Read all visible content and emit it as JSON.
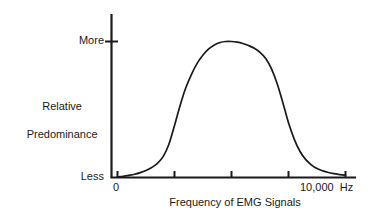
{
  "chart_data": {
    "type": "line",
    "title": "",
    "xlabel": "Frequency of EMG Signals",
    "ylabel": "Relative Predominance",
    "x_unit": "Hz",
    "x_tick_labels": [
      "0",
      "10,000"
    ],
    "x_unit_label": "Hz",
    "x_max_label": "10,000",
    "x_min_label": "0",
    "y_tick_labels": [
      "Less",
      "More"
    ],
    "y_min_label": "Less",
    "y_max_label": "More",
    "ylim": [
      0,
      1.12
    ],
    "xlim": [
      0,
      10000
    ],
    "grid": false,
    "legend": false,
    "axis_color": "#1a1a1a",
    "curve_color": "#1a1a1a",
    "background_color": "#ffffff",
    "x_tick_values": [
      0,
      2500,
      5000,
      7500,
      10000
    ],
    "series": [
      {
        "name": "Relative Predominance of EMG Signals",
        "x": [
          0,
          250,
          500,
          750,
          1000,
          1250,
          1500,
          1750,
          2000,
          2250,
          2500,
          2750,
          3000,
          3250,
          3500,
          3750,
          4000,
          4250,
          4500,
          4750,
          5000,
          5250,
          5500,
          5750,
          6000,
          6250,
          6500,
          6750,
          7000,
          7250,
          7500,
          7750,
          8000,
          8250,
          8500,
          8750,
          9000,
          9250,
          9500,
          9750,
          10000
        ],
        "y": [
          0.0,
          0.005,
          0.012,
          0.02,
          0.032,
          0.048,
          0.07,
          0.1,
          0.15,
          0.24,
          0.38,
          0.53,
          0.66,
          0.76,
          0.84,
          0.9,
          0.945,
          0.975,
          0.993,
          1.0,
          1.0,
          0.995,
          0.985,
          0.97,
          0.95,
          0.92,
          0.875,
          0.8,
          0.69,
          0.55,
          0.4,
          0.28,
          0.19,
          0.13,
          0.09,
          0.062,
          0.045,
          0.033,
          0.025,
          0.018,
          0.012
        ]
      }
    ],
    "annotations": []
  },
  "labels": {
    "y_top": "More",
    "y_bottom": "Less",
    "y_axis_line1": "Relative",
    "y_axis_line2": "Predominance",
    "x_zero": "0",
    "x_max": "10,000  Hz",
    "x_title": "Frequency of EMG Signals"
  }
}
